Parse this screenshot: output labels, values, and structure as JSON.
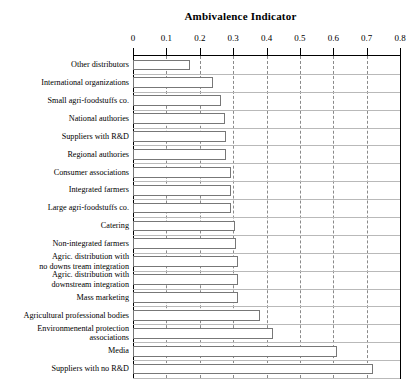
{
  "chart_data": {
    "type": "bar",
    "orientation": "horizontal",
    "title": "Ambivalence Indicator",
    "xlabel": "",
    "ylabel": "",
    "xlim": [
      0,
      0.8
    ],
    "xticks": [
      0,
      0.1,
      0.2,
      0.3,
      0.4,
      0.5,
      0.6,
      0.7,
      0.8
    ],
    "xticklabels": [
      "0",
      "0.1",
      "0.2",
      "0.3",
      "0.4",
      "0.5",
      "0.6",
      "0.7",
      "0.8"
    ],
    "grid": "vertical-dashed",
    "legend": "none",
    "bar_facecolor": "#ffffff",
    "bar_edgecolor": "#777777",
    "categories": [
      "Other distributors",
      "International organizations",
      "Small agri-foodstuffs co.",
      "National authories",
      "Suppliers with R&D",
      "Regional authories",
      "Consumer associations",
      "Integrated farmers",
      "Large agri-foodstuffs co.",
      "Catering",
      "Non-integrated farmers",
      "Agric. distribution with\nno downs tream integration",
      "Agric. distribution with\ndownstream integration",
      "Mass marketing",
      "Agricultural professional bodies",
      "Environmenental protection\nassociations",
      "Media",
      "Suppliers with no R&D"
    ],
    "values": [
      0.17,
      0.24,
      0.265,
      0.275,
      0.28,
      0.28,
      0.295,
      0.295,
      0.295,
      0.305,
      0.31,
      0.315,
      0.315,
      0.315,
      0.38,
      0.42,
      0.61,
      0.72
    ]
  }
}
